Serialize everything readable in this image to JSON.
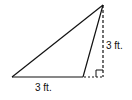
{
  "diagram": {
    "type": "triangle",
    "vertices": {
      "left": [
        12,
        77
      ],
      "inner": [
        83,
        77
      ],
      "apex": [
        103,
        5
      ]
    },
    "height_foot": [
      103,
      77
    ],
    "labels": {
      "base": "3 ft.",
      "height": "3 ft."
    },
    "colors": {
      "stroke": "#111111",
      "background": "#ffffff"
    }
  }
}
